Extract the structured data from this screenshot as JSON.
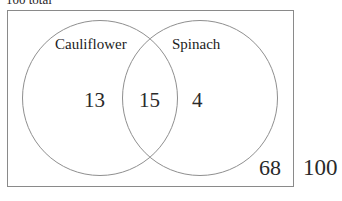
{
  "caption": {
    "total_text": "100 total"
  },
  "diagram": {
    "type": "venn",
    "sets": [
      {
        "name": "cauliflower",
        "label": "Cauliflower"
      },
      {
        "name": "spinach",
        "label": "Spinach"
      }
    ],
    "regions": {
      "left_only": "13",
      "intersection": "15",
      "right_only": "4",
      "outside_circles": "68"
    },
    "grand_total": "100",
    "colors": {
      "stroke": "#8f8f8f",
      "rect_stroke": "#8a8a8a",
      "text": "#1c1c1c",
      "background": "#ffffff"
    }
  },
  "chart_data": {
    "type": "venn",
    "title": "100 total",
    "categories": [
      "Cauliflower only",
      "Both",
      "Spinach only",
      "Neither"
    ],
    "values": [
      13,
      15,
      4,
      68
    ],
    "set_labels": [
      "Cauliflower",
      "Spinach"
    ],
    "set_totals": {
      "Cauliflower": 28,
      "Spinach": 19
    },
    "universe_total": 100,
    "grid": false,
    "legend": "none"
  }
}
